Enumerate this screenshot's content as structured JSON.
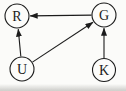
{
  "diagram": {
    "type": "directed-graph",
    "background": "#fbfbf9",
    "line_color": "#1c1c1c",
    "node_fill": "#fcfcfa",
    "node_stroke_width": 1.1,
    "edge_stroke_width": 1.1,
    "nodes": [
      {
        "id": "R",
        "label": "R",
        "x": 17,
        "y": 16,
        "r": 12
      },
      {
        "id": "G",
        "label": "G",
        "x": 104,
        "y": 15,
        "r": 12
      },
      {
        "id": "U",
        "label": "U",
        "x": 22,
        "y": 69,
        "r": 12
      },
      {
        "id": "K",
        "label": "K",
        "x": 104,
        "y": 70,
        "r": 11.5
      }
    ],
    "edges": [
      {
        "from": "G",
        "to": "R"
      },
      {
        "from": "U",
        "to": "R"
      },
      {
        "from": "U",
        "to": "G"
      },
      {
        "from": "K",
        "to": "G"
      }
    ]
  }
}
